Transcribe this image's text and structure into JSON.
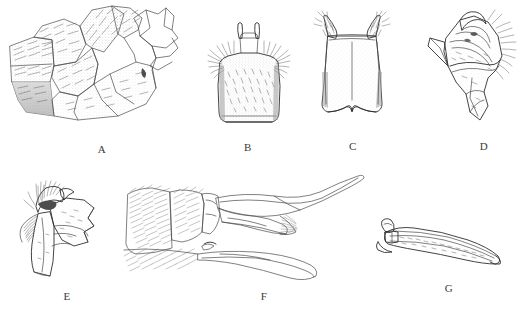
{
  "figure": {
    "background_color": "#ffffff",
    "ink_color": "#4a4a4a",
    "label_color": "#3b3b3b",
    "panel_count": 7
  },
  "panels": [
    {
      "label": "A",
      "label_x": 98,
      "label_y": 143,
      "subject": "lateral view of segmented terminalia with overlapping sclerites",
      "style": "stippled and hatched shading, grey wash",
      "box": {
        "x": 6,
        "y": 6,
        "w": 180,
        "h": 130
      }
    },
    {
      "label": "B",
      "label_x": 240,
      "label_y": 143,
      "subject": "trapezoidal plate with paired dark apical prongs and setose lateral margins",
      "style": "dense stipple with fine setae",
      "box": {
        "x": 208,
        "y": 22,
        "w": 82,
        "h": 112
      }
    },
    {
      "label": "C",
      "label_x": 354,
      "label_y": 143,
      "subject": "tapering plate with dark horn-like apicolateral projections and notched base",
      "style": "light stipple with dark tufts",
      "box": {
        "x": 312,
        "y": 14,
        "w": 80,
        "h": 120
      }
    },
    {
      "label": "D",
      "label_x": 480,
      "label_y": 143,
      "subject": "angular sclerite with hooked processes and marginal setal fringe",
      "style": "outline with stipple shading",
      "box": {
        "x": 428,
        "y": 10,
        "w": 86,
        "h": 124
      }
    },
    {
      "label": "E",
      "label_x": 61,
      "label_y": 292,
      "subject": "angular sclerite with dense apical setal brush",
      "style": "outline with stipple shading",
      "box": {
        "x": 10,
        "y": 174,
        "w": 92,
        "h": 110
      }
    },
    {
      "label": "F",
      "label_x": 258,
      "label_y": 292,
      "subject": "lateral view of abdomen apex with elongate tapering processes",
      "style": "fine line outline with hair strokes",
      "box": {
        "x": 126,
        "y": 172,
        "w": 242,
        "h": 112
      }
    },
    {
      "label": "G",
      "label_x": 449,
      "label_y": 292,
      "subject": "elongate curved blade-like aedeagus with bulbous base and dark apodeme",
      "style": "outline with light stipple",
      "box": {
        "x": 374,
        "y": 222,
        "w": 134,
        "h": 56
      }
    }
  ]
}
